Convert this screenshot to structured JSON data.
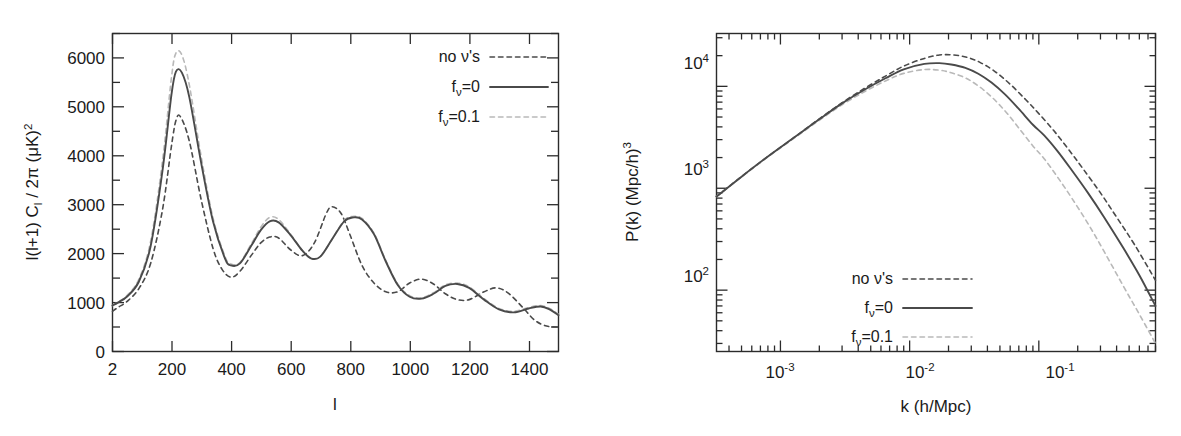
{
  "figure": {
    "background": "#ffffff",
    "ink": "#1a1a1a"
  },
  "colors": {
    "no_neutrinos": "#4a4a4a",
    "fnu_0": "#4a4a4a",
    "fnu_01": "#b9b9b9",
    "frame": "#2b2b2b"
  },
  "legend": {
    "items": [
      {
        "label": "no ν's",
        "style": "dotted",
        "color": "#4a4a4a"
      },
      {
        "label": "fν=0",
        "label_base": "f",
        "label_sub": "ν",
        "label_rest": "=0",
        "style": "solid",
        "color": "#4a4a4a"
      },
      {
        "label": "fν=0.1",
        "label_base": "f",
        "label_sub": "ν",
        "label_rest": "=0.1",
        "style": "dashed",
        "color": "#b9b9b9"
      }
    ]
  },
  "chart_data": [
    {
      "type": "line",
      "id": "cmb-power-spectrum",
      "title": "",
      "xlabel": "l",
      "ylabel_parts": [
        "l(l+1) C",
        "l",
        " / 2π  (μK)",
        "2"
      ],
      "ylabel": "l(l+1) C_l / 2π  (μK)^2",
      "xscale": "linear",
      "yscale": "linear",
      "xlim": [
        2,
        1500
      ],
      "ylim": [
        0,
        6500
      ],
      "xticks": [
        2,
        200,
        400,
        600,
        800,
        1000,
        1200,
        1400
      ],
      "xticklabels": [
        "2",
        "200",
        "400",
        "600",
        "800",
        "1000",
        "1200",
        "1400"
      ],
      "yticks": [
        0,
        1000,
        2000,
        3000,
        4000,
        5000,
        6000
      ],
      "yticklabels": [
        "0",
        "1000",
        "2000",
        "3000",
        "4000",
        "5000",
        "6000"
      ],
      "yminorticks": [
        500,
        1500,
        2500,
        3500,
        4500,
        5500,
        6500
      ],
      "grid": false,
      "legend_position": "top-right",
      "series": [
        {
          "name": "no ν's",
          "style": "dotted",
          "color": "#4a4a4a",
          "x": [
            2,
            20,
            50,
            90,
            130,
            170,
            200,
            215,
            230,
            260,
            300,
            340,
            370,
            400,
            430,
            470,
            500,
            530,
            560,
            600,
            640,
            680,
            720,
            740,
            770,
            800,
            840,
            880,
            920,
            960,
            1000,
            1040,
            1080,
            1120,
            1160,
            1200,
            1250,
            1290,
            1330,
            1380,
            1420,
            1460,
            1500
          ],
          "y": [
            820,
            900,
            1020,
            1280,
            1800,
            2900,
            4200,
            4720,
            4800,
            4300,
            3100,
            2100,
            1680,
            1520,
            1640,
            1980,
            2220,
            2340,
            2320,
            2080,
            1960,
            2220,
            2820,
            2960,
            2820,
            2380,
            1760,
            1400,
            1220,
            1220,
            1400,
            1480,
            1380,
            1180,
            1060,
            1060,
            1220,
            1300,
            1200,
            900,
            640,
            520,
            500
          ]
        },
        {
          "name": "fν=0",
          "style": "solid",
          "color": "#4a4a4a",
          "x": [
            2,
            20,
            50,
            90,
            130,
            170,
            200,
            215,
            235,
            260,
            300,
            340,
            380,
            400,
            430,
            470,
            500,
            530,
            560,
            600,
            640,
            670,
            700,
            740,
            780,
            810,
            840,
            880,
            920,
            960,
            1000,
            1040,
            1080,
            1120,
            1160,
            1200,
            1250,
            1300,
            1350,
            1400,
            1440,
            1470,
            1500
          ],
          "y": [
            940,
            1000,
            1120,
            1420,
            2150,
            3700,
            5250,
            5720,
            5700,
            5200,
            3850,
            2650,
            1900,
            1760,
            1800,
            2180,
            2480,
            2660,
            2640,
            2380,
            2060,
            1900,
            1940,
            2300,
            2660,
            2740,
            2700,
            2400,
            1840,
            1360,
            1120,
            1080,
            1180,
            1340,
            1380,
            1300,
            1060,
            860,
            800,
            880,
            920,
            860,
            740
          ]
        },
        {
          "name": "fν=0.1",
          "style": "dashed",
          "color": "#b9b9b9",
          "x": [
            2,
            20,
            50,
            90,
            130,
            170,
            200,
            215,
            235,
            260,
            300,
            340,
            380,
            400,
            430,
            470,
            500,
            530,
            560,
            600,
            640,
            670,
            700,
            740,
            780,
            810,
            840,
            880,
            920,
            960,
            1000,
            1040,
            1080,
            1120,
            1160,
            1200,
            1250,
            1300,
            1350,
            1400,
            1440,
            1470,
            1500
          ],
          "y": [
            940,
            1010,
            1140,
            1470,
            2250,
            3900,
            5600,
            6100,
            6060,
            5450,
            3980,
            2720,
            1940,
            1790,
            1820,
            2220,
            2540,
            2740,
            2700,
            2400,
            2060,
            1900,
            1940,
            2300,
            2680,
            2760,
            2720,
            2420,
            1860,
            1380,
            1140,
            1100,
            1200,
            1360,
            1400,
            1320,
            1080,
            880,
            820,
            900,
            940,
            880,
            760
          ]
        }
      ]
    },
    {
      "type": "line",
      "id": "matter-power-spectrum",
      "title": "",
      "xlabel_parts": [
        "k   (h/Mpc)"
      ],
      "xlabel": "k   (h/Mpc)",
      "ylabel_parts": [
        "P(k)   (Mpc/h)",
        "3"
      ],
      "ylabel": "P(k)   (Mpc/h)^3",
      "xscale": "log",
      "yscale": "log",
      "xlim": [
        0.00032,
        0.8
      ],
      "ylim": [
        25,
        33000
      ],
      "xticks": [
        0.001,
        0.01,
        0.1
      ],
      "xticklabels": [
        "10^-3",
        "10^-2",
        "10^-1"
      ],
      "yticks": [
        100,
        1000,
        10000
      ],
      "yticklabels": [
        "10^2",
        "10^3",
        "10^4"
      ],
      "grid": false,
      "legend_position": "lower-center",
      "series": [
        {
          "name": "no ν's",
          "style": "dotted",
          "color": "#4a4a4a",
          "x": [
            0.00032,
            0.0005,
            0.0008,
            0.0013,
            0.002,
            0.003,
            0.0045,
            0.0065,
            0.009,
            0.013,
            0.017,
            0.022,
            0.028,
            0.035,
            0.045,
            0.06,
            0.08,
            0.1,
            0.13,
            0.17,
            0.22,
            0.3,
            0.4,
            0.55,
            0.8
          ],
          "y": [
            830,
            1300,
            2050,
            3200,
            4800,
            6900,
            9600,
            12600,
            15800,
            18800,
            20300,
            20300,
            19200,
            17200,
            14200,
            10500,
            7300,
            5400,
            3700,
            2400,
            1550,
            900,
            520,
            280,
            125
          ]
        },
        {
          "name": "fν=0",
          "style": "solid",
          "color": "#4a4a4a",
          "x": [
            0.00032,
            0.0005,
            0.0008,
            0.0013,
            0.002,
            0.003,
            0.0045,
            0.0065,
            0.009,
            0.013,
            0.017,
            0.021,
            0.027,
            0.034,
            0.043,
            0.055,
            0.07,
            0.09,
            0.11,
            0.14,
            0.18,
            0.24,
            0.32,
            0.45,
            0.6,
            0.8
          ],
          "y": [
            830,
            1300,
            2050,
            3200,
            4750,
            6800,
            9300,
            12000,
            14700,
            16600,
            16900,
            16400,
            15200,
            13300,
            10900,
            8300,
            6000,
            4200,
            3300,
            2300,
            1500,
            900,
            520,
            260,
            140,
            70
          ]
        },
        {
          "name": "fν=0.1",
          "style": "dashed",
          "color": "#b9b9b9",
          "x": [
            0.00032,
            0.0005,
            0.0008,
            0.0013,
            0.002,
            0.003,
            0.0045,
            0.0065,
            0.009,
            0.013,
            0.017,
            0.021,
            0.027,
            0.034,
            0.043,
            0.055,
            0.07,
            0.09,
            0.11,
            0.14,
            0.18,
            0.24,
            0.32,
            0.45,
            0.6,
            0.8
          ],
          "y": [
            830,
            1290,
            2030,
            3150,
            4650,
            6600,
            8900,
            11300,
            13400,
            14600,
            14400,
            13600,
            12100,
            10100,
            7900,
            5700,
            3900,
            2600,
            1950,
            1280,
            800,
            450,
            240,
            110,
            58,
            30
          ]
        }
      ]
    }
  ]
}
